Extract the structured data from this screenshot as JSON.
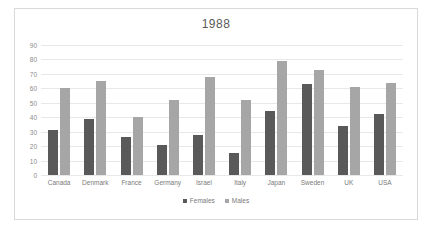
{
  "chart_data": {
    "type": "bar",
    "title": "1988",
    "xlabel": "",
    "ylabel": "",
    "ylim": [
      0,
      90
    ],
    "ytick_step": 10,
    "yticks": [
      90,
      80,
      70,
      60,
      50,
      40,
      30,
      20,
      10,
      0
    ],
    "grid": true,
    "legend_position": "bottom",
    "categories": [
      "Canada",
      "Denmark",
      "France",
      "Germany",
      "Israel",
      "Italy",
      "Japan",
      "Sweden",
      "UK",
      "USA"
    ],
    "series": [
      {
        "name": "Females",
        "color": "#595959",
        "values": [
          31,
          39,
          26,
          21,
          28,
          15,
          44,
          63,
          34,
          42
        ]
      },
      {
        "name": "Males",
        "color": "#a6a6a6",
        "values": [
          60,
          65,
          40,
          52,
          68,
          52,
          79,
          73,
          61,
          64
        ]
      }
    ]
  }
}
